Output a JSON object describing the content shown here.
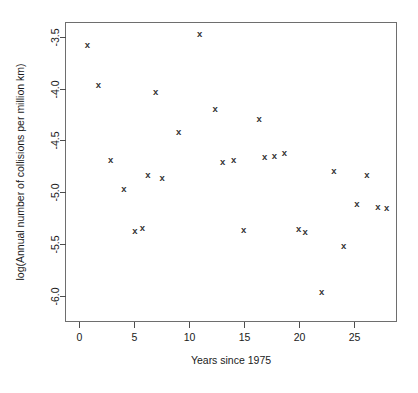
{
  "chart_data": {
    "type": "scatter",
    "title": "",
    "xlabel": "Years since 1975",
    "ylabel": "log(Annual number of collisions per million km)",
    "xlim": [
      -1.2,
      28.9
    ],
    "ylim": [
      -6.25,
      -3.36
    ],
    "xticks": [
      0,
      5,
      10,
      15,
      20,
      25
    ],
    "xtick_labels": [
      "0",
      "5",
      "10",
      "15",
      "20",
      "25"
    ],
    "yticks": [
      -3.5,
      -4.0,
      -4.5,
      -5.0,
      -5.5,
      -6.0
    ],
    "ytick_labels": [
      "-3.5",
      "-4.0",
      "-4.5",
      "-5.0",
      "-5.5",
      "-6.0"
    ],
    "grid": false,
    "legend": null,
    "marker": "x",
    "marker_color": "#333333",
    "points": [
      {
        "x": 0.8,
        "y": -3.57
      },
      {
        "x": 1.8,
        "y": -3.96
      },
      {
        "x": 2.9,
        "y": -4.68
      },
      {
        "x": 4.1,
        "y": -4.96
      },
      {
        "x": 5.1,
        "y": -5.37
      },
      {
        "x": 5.8,
        "y": -5.34
      },
      {
        "x": 6.3,
        "y": -4.83
      },
      {
        "x": 7.0,
        "y": -4.03
      },
      {
        "x": 7.6,
        "y": -4.86
      },
      {
        "x": 9.1,
        "y": -4.41
      },
      {
        "x": 11.0,
        "y": -3.47
      },
      {
        "x": 12.4,
        "y": -4.19
      },
      {
        "x": 13.1,
        "y": -4.7
      },
      {
        "x": 14.1,
        "y": -4.68
      },
      {
        "x": 15.0,
        "y": -5.36
      },
      {
        "x": 16.4,
        "y": -4.29
      },
      {
        "x": 16.9,
        "y": -4.66
      },
      {
        "x": 17.8,
        "y": -4.65
      },
      {
        "x": 18.7,
        "y": -4.62
      },
      {
        "x": 20.0,
        "y": -5.35
      },
      {
        "x": 20.6,
        "y": -5.38
      },
      {
        "x": 22.1,
        "y": -5.96
      },
      {
        "x": 23.2,
        "y": -4.79
      },
      {
        "x": 24.1,
        "y": -5.52
      },
      {
        "x": 25.3,
        "y": -5.11
      },
      {
        "x": 26.2,
        "y": -4.83
      },
      {
        "x": 27.2,
        "y": -5.14
      },
      {
        "x": 28.0,
        "y": -5.15
      }
    ]
  }
}
